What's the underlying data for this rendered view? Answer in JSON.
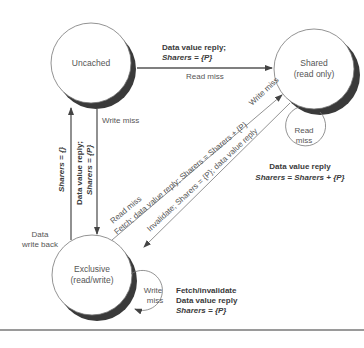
{
  "states": {
    "uncached": {
      "label": "Uncached"
    },
    "shared": {
      "label": "Shared",
      "sublabel": "(read only)"
    },
    "exclusive": {
      "label": "Exclusive",
      "sublabel": "(read/write)"
    }
  },
  "transitions": {
    "uncached_to_shared": {
      "action_line1": "Data value reply;",
      "action_line2": "Sharers = {P}",
      "trigger": "Read miss"
    },
    "uncached_to_exclusive": {
      "trigger": "Write miss",
      "action_line1": "Data value reply;",
      "action_line2": "Sharers = {P}"
    },
    "exclusive_to_uncached": {
      "trigger_line1": "Data",
      "trigger_line2": "write back",
      "action": "Sharers = {}"
    },
    "exclusive_to_shared": {
      "trigger": "Read miss",
      "action": "Fetch; data value reply; Sharers = Sharers + {P}"
    },
    "shared_to_exclusive": {
      "trigger": "Write miss",
      "action": "Invalidate; Sharers = {P}; data value reply"
    },
    "shared_self": {
      "trigger_line1": "Read",
      "trigger_line2": "miss",
      "action_line1": "Data value reply",
      "action_line2": "Sharers = Sharers + {P}"
    },
    "exclusive_self": {
      "trigger_line1": "Write",
      "trigger_line2": "miss",
      "action_line1": "Fetch/invalidate",
      "action_line2": "Data value reply",
      "action_line3": "Sharers = {P}"
    }
  }
}
